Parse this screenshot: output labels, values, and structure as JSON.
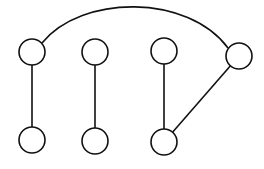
{
  "diagram": {
    "type": "graph",
    "directed": false,
    "nodes": [
      {
        "id": "A"
      },
      {
        "id": "B"
      },
      {
        "id": "C"
      },
      {
        "id": "D"
      },
      {
        "id": "E"
      },
      {
        "id": "F"
      },
      {
        "id": "G"
      }
    ],
    "edges": [
      {
        "from": "A",
        "to": "E",
        "shape": "straight"
      },
      {
        "from": "B",
        "to": "F",
        "shape": "straight"
      },
      {
        "from": "C",
        "to": "G",
        "shape": "straight"
      },
      {
        "from": "G",
        "to": "D",
        "shape": "straight"
      },
      {
        "from": "A",
        "to": "D",
        "shape": "arc"
      }
    ],
    "colors": {
      "stroke": "#111111",
      "fill": "#ffffff",
      "background": "#ffffff"
    }
  }
}
